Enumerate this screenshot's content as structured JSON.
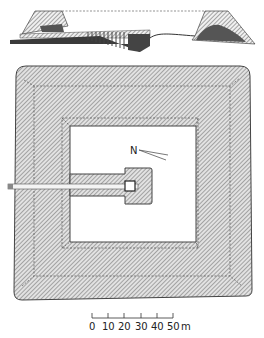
{
  "diagram": {
    "type": "archaeological plan and section",
    "section_view": "cross-section of pyramid with descending passage",
    "plan_view": "square enclosure with inner courtyard and entrance passage",
    "north_label": "N",
    "scale_bar": {
      "ticks": [
        "0",
        "10",
        "20",
        "30",
        "40",
        "50"
      ],
      "unit": "m"
    },
    "colors": {
      "ink": "#333333",
      "hatch": "#8a8a8a",
      "fill_light": "#d9d9d9",
      "dark_fill": "#555555"
    }
  }
}
